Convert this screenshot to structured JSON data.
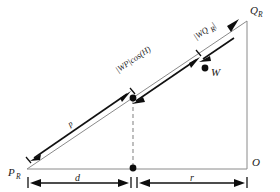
{
  "figure": {
    "type": "geometry-diagram",
    "background_color": "#ffffff",
    "line_color": "#8a8a8a",
    "arrow_color": "#111111",
    "vertices": {
      "p_left": {
        "label": "P",
        "subscript": "R",
        "x": 18,
        "y": 168
      },
      "q_top": {
        "label": "Q",
        "subscript": "R",
        "x": 240,
        "y": 14
      },
      "o_right": {
        "label": "O",
        "subscript": "",
        "x": 248,
        "y": 163
      },
      "w_point": {
        "label": "W",
        "subscript": "",
        "x": 205,
        "y": 68
      },
      "mid_hyp": {
        "label": "",
        "subscript": "",
        "x": 133,
        "y": 98
      },
      "foot_base": {
        "label": "",
        "subscript": "",
        "x": 133,
        "y": 168
      }
    },
    "segments": {
      "hypotenuse_label": "|WP|cos(H)",
      "upper_label": "|WQ",
      "upper_label_sub": "R",
      "upper_label_end": "|",
      "diagonal_label": "p"
    },
    "dimensions": {
      "left_label": "d",
      "right_label": "r"
    }
  }
}
